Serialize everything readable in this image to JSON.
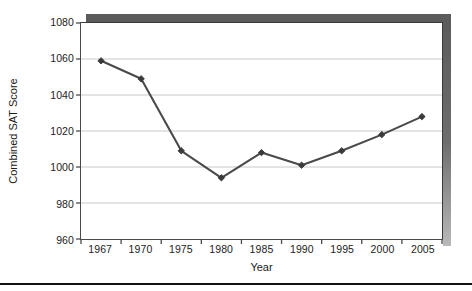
{
  "chart_data": {
    "type": "line",
    "title": "",
    "xlabel": "Year",
    "ylabel": "Combined SAT Score",
    "categories": [
      "1967",
      "1970",
      "1975",
      "1980",
      "1985",
      "1990",
      "1995",
      "2000",
      "2005"
    ],
    "values": [
      1059,
      1049,
      1009,
      994,
      1008,
      1001,
      1009,
      1018,
      1028
    ],
    "series": [
      {
        "name": "Combined SAT Score",
        "values": [
          1059,
          1049,
          1009,
          994,
          1008,
          1001,
          1009,
          1018,
          1028
        ]
      }
    ],
    "ylim": [
      960,
      1080
    ],
    "yticks": [
      960,
      980,
      1000,
      1020,
      1040,
      1060,
      1080
    ],
    "ytick_labels": [
      "960",
      "980",
      "1000",
      "1020",
      "1040",
      "1060",
      "1080"
    ],
    "grid": "horizontal",
    "legend": "none",
    "marker": "diamond",
    "line_color": "#4a4a4a",
    "marker_color": "#3a3a3a",
    "grid_color": "#c8c8c8",
    "axis_color": "#4a4a4a",
    "frame_shadow_color": "#5b5b5b"
  }
}
